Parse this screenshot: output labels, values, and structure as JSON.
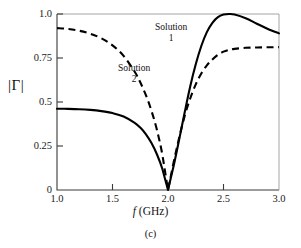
{
  "figure": {
    "caption": "(c)",
    "y_axis_title": "|Γ|",
    "x_axis_title_variable": "f",
    "x_axis_title_unit": "(GHz)"
  },
  "annotations": [
    {
      "name": "solution-1",
      "line1": "Solution",
      "line2": "1"
    },
    {
      "name": "solution-2",
      "line1": "Solution",
      "line2": "2"
    }
  ],
  "chart_data": {
    "type": "line",
    "title": "",
    "subtitle": "",
    "caption": "(c)",
    "xlabel": "f (GHz)",
    "ylabel": "|Γ|",
    "xlim": [
      1.0,
      3.0
    ],
    "ylim": [
      0.0,
      1.0
    ],
    "grid": false,
    "legend": "inline-annotations",
    "xticks": [
      1.0,
      1.5,
      2.0,
      2.5,
      3.0
    ],
    "xtick_labels": [
      "1.0",
      "1.5",
      "2.0",
      "2.5",
      "3.0"
    ],
    "yticks": [
      0,
      0.25,
      0.5,
      0.75,
      1.0
    ],
    "ytick_labels": [
      "0",
      "0.25",
      "0.5",
      "0.75",
      "1.0"
    ],
    "series": [
      {
        "name": "Solution 1",
        "style": "solid",
        "color": "#000000",
        "x": [
          1.0,
          1.1,
          1.2,
          1.3,
          1.4,
          1.5,
          1.6,
          1.7,
          1.75,
          1.8,
          1.85,
          1.9,
          1.95,
          2.0,
          2.05,
          2.1,
          2.15,
          2.2,
          2.25,
          2.3,
          2.35,
          2.4,
          2.45,
          2.5,
          2.55,
          2.6,
          2.7,
          2.8,
          2.9,
          3.0
        ],
        "values": [
          0.462,
          0.461,
          0.459,
          0.455,
          0.448,
          0.437,
          0.418,
          0.382,
          0.355,
          0.318,
          0.268,
          0.203,
          0.118,
          0.0,
          0.135,
          0.285,
          0.44,
          0.588,
          0.714,
          0.818,
          0.897,
          0.95,
          0.982,
          0.997,
          1.0,
          0.997,
          0.976,
          0.945,
          0.915,
          0.89
        ]
      },
      {
        "name": "Solution 2",
        "style": "dashed",
        "color": "#000000",
        "x": [
          1.0,
          1.1,
          1.2,
          1.3,
          1.4,
          1.5,
          1.6,
          1.7,
          1.75,
          1.8,
          1.85,
          1.9,
          1.95,
          2.0,
          2.05,
          2.1,
          2.15,
          2.2,
          2.25,
          2.3,
          2.35,
          2.4,
          2.45,
          2.5,
          2.55,
          2.6,
          2.7,
          2.8,
          2.9,
          3.0
        ],
        "values": [
          0.92,
          0.915,
          0.905,
          0.888,
          0.862,
          0.822,
          0.762,
          0.672,
          0.612,
          0.54,
          0.452,
          0.342,
          0.198,
          0.0,
          0.155,
          0.295,
          0.42,
          0.52,
          0.6,
          0.662,
          0.708,
          0.742,
          0.768,
          0.786,
          0.796,
          0.802,
          0.808,
          0.81,
          0.811,
          0.812
        ]
      }
    ]
  }
}
